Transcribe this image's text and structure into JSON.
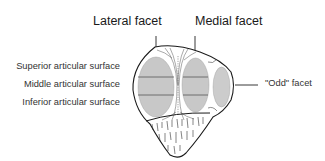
{
  "figure": {
    "labels": {
      "lateral_facet": "Lateral facet",
      "medial_facet": "Medial facet",
      "superior": "Superior articular surface",
      "middle": "Middle articular surface",
      "inferior": "Inferior articular surface",
      "odd_facet": "\"Odd\" facet"
    },
    "colors": {
      "outline": "#1a1a1a",
      "facet_fill": "#c8c8c8",
      "facet_dividers": "#555555",
      "background": "#ffffff"
    }
  }
}
